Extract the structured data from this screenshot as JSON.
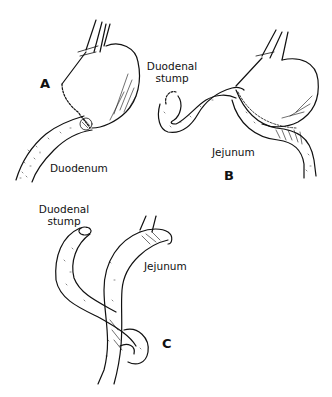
{
  "figure": {
    "panels": [
      {
        "id": "A",
        "letter": "A",
        "labels": {
          "duodenum": "Duodenum"
        }
      },
      {
        "id": "B",
        "letter": "B",
        "labels": {
          "duodenal_stump_line1": "Duodenal",
          "duodenal_stump_line2": "stump",
          "jejunum": "Jejunum"
        }
      },
      {
        "id": "C",
        "letter": "C",
        "labels": {
          "duodenal_stump_line1": "Duodenal",
          "duodenal_stump_line2": "stump",
          "jejunum": "Jejunum"
        }
      }
    ],
    "colors": {
      "ink": "#111111",
      "background": "#ffffff"
    }
  }
}
